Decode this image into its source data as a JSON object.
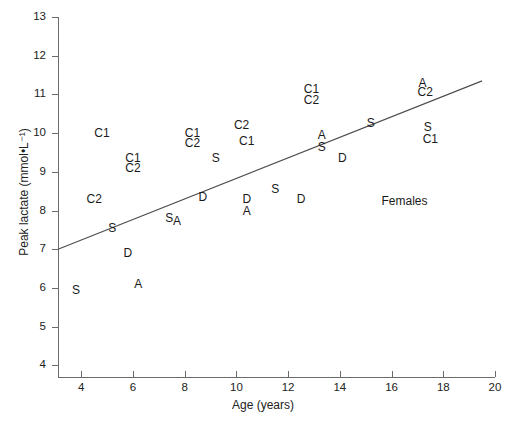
{
  "chart_data": {
    "type": "scatter",
    "title": "",
    "xlabel": "Age (years)",
    "ylabel": "Peak lactate (mmol•L⁻¹)",
    "xlim": [
      3.1,
      20
    ],
    "ylim": [
      3.7,
      13
    ],
    "xticks": [
      4,
      6,
      8,
      10,
      12,
      14,
      16,
      18,
      20
    ],
    "yticks": [
      4,
      5,
      6,
      7,
      8,
      9,
      10,
      11,
      12,
      13
    ],
    "grid": false,
    "legend": null,
    "annotations": [
      {
        "text": "Females",
        "x": 16.5,
        "y": 8.25
      }
    ],
    "trendline": {
      "label": "regression-line",
      "x0": 3.1,
      "y0": 7.0,
      "x1": 19.5,
      "y1": 11.35
    },
    "point_marker_style": "text-letter-code",
    "marker_codes": [
      "C1",
      "C2",
      "S",
      "D",
      "A"
    ],
    "points": [
      {
        "label": "C1",
        "x": 4.8,
        "y": 10.0
      },
      {
        "label": "C2",
        "x": 4.5,
        "y": 8.3
      },
      {
        "label": "S",
        "x": 3.8,
        "y": 5.95
      },
      {
        "label": "S",
        "x": 5.2,
        "y": 7.55
      },
      {
        "label": "D",
        "x": 5.8,
        "y": 6.9
      },
      {
        "label": "A",
        "x": 6.2,
        "y": 6.1
      },
      {
        "label": "C1",
        "x": 6.0,
        "y": 9.35
      },
      {
        "label": "C2",
        "x": 6.0,
        "y": 9.1
      },
      {
        "label": "S",
        "x": 7.4,
        "y": 7.8
      },
      {
        "label": "A",
        "x": 7.7,
        "y": 7.72
      },
      {
        "label": "C1",
        "x": 8.3,
        "y": 10.0
      },
      {
        "label": "C2",
        "x": 8.3,
        "y": 9.75
      },
      {
        "label": "D",
        "x": 8.7,
        "y": 8.35
      },
      {
        "label": "S",
        "x": 9.2,
        "y": 9.35
      },
      {
        "label": "C2",
        "x": 10.2,
        "y": 10.2
      },
      {
        "label": "C1",
        "x": 10.4,
        "y": 9.8
      },
      {
        "label": "D",
        "x": 10.4,
        "y": 8.3
      },
      {
        "label": "A",
        "x": 10.4,
        "y": 8.0
      },
      {
        "label": "S",
        "x": 11.5,
        "y": 8.55
      },
      {
        "label": "D",
        "x": 12.5,
        "y": 8.3
      },
      {
        "label": "C1",
        "x": 12.9,
        "y": 11.15
      },
      {
        "label": "C2",
        "x": 12.9,
        "y": 10.85
      },
      {
        "label": "A",
        "x": 13.3,
        "y": 9.95
      },
      {
        "label": "S",
        "x": 13.3,
        "y": 9.65
      },
      {
        "label": "D",
        "x": 14.1,
        "y": 9.35
      },
      {
        "label": "S",
        "x": 15.2,
        "y": 10.25
      },
      {
        "label": "A",
        "x": 17.2,
        "y": 11.3
      },
      {
        "label": "C2",
        "x": 17.3,
        "y": 11.05
      },
      {
        "label": "S",
        "x": 17.4,
        "y": 10.15
      },
      {
        "label": "C1",
        "x": 17.5,
        "y": 9.85
      }
    ]
  }
}
